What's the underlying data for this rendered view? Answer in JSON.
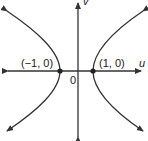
{
  "diagram": {
    "axes": {
      "horizontal": "u",
      "vertical": "v"
    },
    "origin_label": "0",
    "points": [
      {
        "label": "(−1, 0)",
        "u": -1,
        "v": 0
      },
      {
        "label": "(1, 0)",
        "u": 1,
        "v": 0
      }
    ],
    "stroke_color": "#333333"
  }
}
